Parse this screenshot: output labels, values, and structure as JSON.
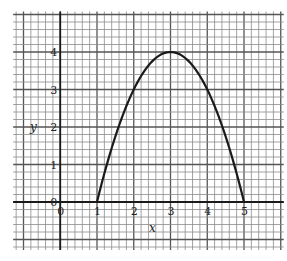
{
  "chart_data": {
    "type": "line",
    "title": "",
    "xlabel": "x",
    "ylabel": "y",
    "xlim": [
      -1.2,
      6
    ],
    "ylim": [
      -1.2,
      5
    ],
    "grid": true,
    "minor_per_unit": 5,
    "x_ticks": [
      "0",
      "1",
      "2",
      "3",
      "4",
      "5"
    ],
    "y_ticks": [
      "0",
      "1",
      "2",
      "3",
      "4"
    ],
    "series": [
      {
        "name": "y = -(x-1)(x-5)",
        "x": [
          1,
          1.5,
          2,
          2.5,
          3,
          3.5,
          4,
          4.5,
          5
        ],
        "y": [
          0,
          1.75,
          3,
          3.75,
          4,
          3.75,
          3,
          1.75,
          0
        ]
      }
    ],
    "annotations": [
      {
        "text": "vertex",
        "x": 3,
        "y": 4
      }
    ]
  },
  "labels": {
    "x_axis": "x",
    "y_axis": "y",
    "origin_x": "0",
    "origin_y": "0"
  }
}
